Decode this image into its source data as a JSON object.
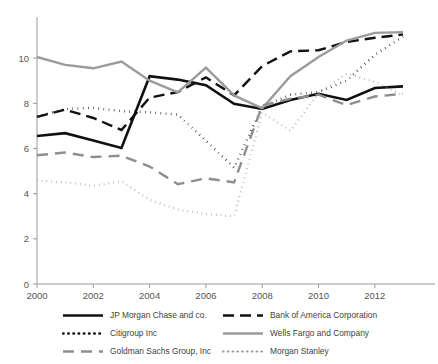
{
  "chart_data": {
    "type": "line",
    "title": "",
    "xlabel": "",
    "ylabel": "",
    "xlim": [
      2000,
      2013
    ],
    "ylim": [
      0,
      11.6
    ],
    "grid": false,
    "legend_position": "bottom",
    "x": [
      2000,
      2001,
      2002,
      2003,
      2004,
      2005,
      2006,
      2007,
      2008,
      2009,
      2010,
      2011,
      2012,
      2013
    ],
    "xticks": [
      "2000",
      "2002",
      "2004",
      "2006",
      "2008",
      "2010",
      "2012"
    ],
    "xtick_values": [
      2000,
      2002,
      2004,
      2006,
      2008,
      2010,
      2012
    ],
    "yticks": [
      "0",
      "2",
      "4",
      "6",
      "8",
      "10"
    ],
    "ytick_values": [
      0,
      2,
      4,
      6,
      8,
      10
    ],
    "series": [
      {
        "name": "JP Morgan Chase and co.",
        "style": "solid",
        "color": "#111111",
        "width": 2.6,
        "dash": "none",
        "values": [
          6.55,
          6.68,
          6.35,
          6.02,
          9.2,
          9.05,
          8.8,
          7.98,
          7.75,
          8.15,
          8.42,
          8.15,
          8.68,
          8.75
        ]
      },
      {
        "name": "Bank of America Corporation",
        "style": "dashed",
        "color": "#111111",
        "width": 2.4,
        "dash": "11 6",
        "values": [
          7.4,
          7.72,
          7.35,
          6.82,
          8.25,
          8.5,
          9.15,
          8.35,
          9.65,
          10.3,
          10.35,
          10.72,
          10.9,
          11.05
        ]
      },
      {
        "name": "Citigroup Inc",
        "style": "dotted",
        "color": "#111111",
        "width": 2.4,
        "dash": "0.6 4.6",
        "values": [
          7.42,
          7.75,
          7.8,
          7.65,
          7.6,
          7.5,
          6.35,
          5.15,
          7.85,
          8.38,
          8.5,
          9.0,
          10.15,
          10.95
        ]
      },
      {
        "name": "Wells Fargo and Company",
        "style": "solid",
        "color": "#9b9b9b",
        "width": 2.4,
        "dash": "none",
        "values": [
          10.05,
          9.7,
          9.55,
          9.85,
          9.0,
          8.48,
          9.58,
          8.35,
          7.78,
          9.2,
          10.05,
          10.78,
          11.12,
          11.15
        ]
      },
      {
        "name": "Goldman Sachs Group, Inc",
        "style": "dashed",
        "color": "#8e8e8e",
        "width": 2.4,
        "dash": "11 7",
        "values": [
          5.7,
          5.82,
          5.62,
          5.68,
          5.2,
          4.42,
          4.68,
          4.5,
          7.9,
          8.2,
          8.38,
          7.92,
          8.3,
          8.42
        ]
      },
      {
        "name": "Morgan Stanley",
        "style": "dotted",
        "color": "#9b9b9b",
        "width": 2.2,
        "dash": "0.6 4.2",
        "values": [
          4.58,
          4.5,
          4.35,
          4.55,
          3.72,
          3.3,
          3.1,
          3.0,
          7.6,
          6.78,
          8.45,
          9.32,
          8.95,
          8.35
        ]
      }
    ]
  },
  "legend": {
    "entries": [
      {
        "label": "JP Morgan Chase and co.",
        "series_index": 0
      },
      {
        "label": "Bank of America Corporation",
        "series_index": 1
      },
      {
        "label": "Citigroup Inc",
        "series_index": 2
      },
      {
        "label": "Wells Fargo and Company",
        "series_index": 3
      },
      {
        "label": "Goldman Sachs Group, Inc",
        "series_index": 4
      },
      {
        "label": "Morgan Stanley",
        "series_index": 5
      }
    ]
  }
}
